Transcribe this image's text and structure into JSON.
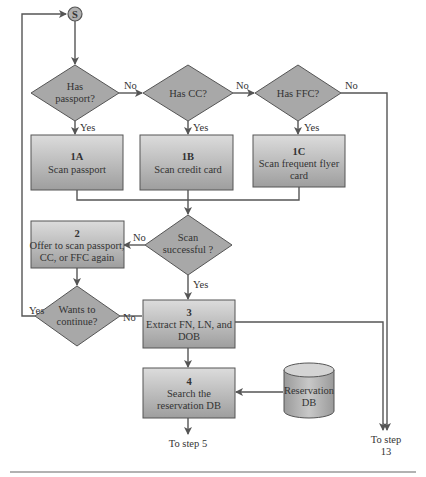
{
  "diagram": {
    "start": {
      "label": "S"
    },
    "decisions": {
      "has_passport": {
        "line1": "Has",
        "line2": "passport?"
      },
      "has_cc": {
        "line1": "Has CC?"
      },
      "has_ffc": {
        "line1": "Has FFC?"
      },
      "scan_successful": {
        "line1": "Scan",
        "line2": "successful ?"
      },
      "wants_continue": {
        "line1": "Wants to",
        "line2": "continue?"
      }
    },
    "steps": {
      "s1a": {
        "num": "1A",
        "line1": "Scan passport"
      },
      "s1b": {
        "num": "1B",
        "line1": "Scan credit card"
      },
      "s1c": {
        "num": "1C",
        "line1": "Scan frequent flyer",
        "line2": "card"
      },
      "s2": {
        "num": "2",
        "line1": "Offer to scan passport,",
        "line2": "CC, or FFC again"
      },
      "s3": {
        "num": "3",
        "line1": "Extract FN, LN, and",
        "line2": "DOB"
      },
      "s4": {
        "num": "4",
        "line1": "Search the",
        "line2": "reservation DB"
      }
    },
    "database": {
      "line1": "Reservation",
      "line2": "DB"
    },
    "edge_labels": {
      "yes": "Yes",
      "no": "No"
    },
    "terminals": {
      "to_step5": "To step 5",
      "to_step13_line1": "To step",
      "to_step13_line2": "13"
    },
    "colors": {
      "box_top": "#d8d8d8",
      "box_bottom": "#a4a4a4",
      "diamond": "#a8a8a8",
      "stroke": "#555555"
    }
  }
}
